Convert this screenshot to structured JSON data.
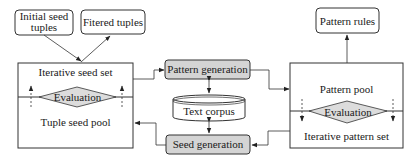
{
  "diagram": {
    "nodes": {
      "initial_seed_tuples": "Initial seed tuples",
      "filtered_tuples": "Fitered tuples",
      "iterative_seed_set": "Iterative seed set",
      "left_evaluation": "Evaluation",
      "tuple_seed_pool": "Tuple seed pool",
      "pattern_generation": "Pattern generation",
      "text_corpus": "Text corpus",
      "seed_generation": "Seed generation",
      "pattern_pool": "Pattern pool",
      "right_evaluation": "Evaluation",
      "iterative_pattern_set": "Iterative pattern set",
      "pattern_rules": "Pattern rules"
    },
    "edges": [
      {
        "from": "Initial seed tuples",
        "to": "Iterative seed set"
      },
      {
        "from": "Iterative seed set",
        "to": "Fitered tuples"
      },
      {
        "from": "Iterative seed set",
        "to": "Pattern generation"
      },
      {
        "from": "Pattern generation",
        "to": "Pattern pool"
      },
      {
        "from": "Pattern generation",
        "to": "Text corpus",
        "bidirectional": true
      },
      {
        "from": "Text corpus",
        "to": "Seed generation",
        "bidirectional": true
      },
      {
        "from": "Iterative pattern set",
        "to": "Seed generation"
      },
      {
        "from": "Seed generation",
        "to": "Tuple seed pool"
      },
      {
        "from": "Pattern pool",
        "to": "Pattern rules"
      },
      {
        "from": "Tuple seed pool",
        "to": "Iterative seed set",
        "style": "dashed"
      },
      {
        "from": "Pattern pool",
        "to": "Iterative pattern set",
        "style": "dashed"
      }
    ],
    "colors": {
      "stroke": "#333333",
      "process_fill": "#d4d4d4",
      "diamond_fill": "#dcdcdc"
    }
  }
}
